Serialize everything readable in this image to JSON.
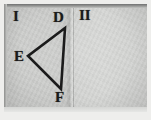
{
  "image": {
    "subject": "folded-paper-geometry-sketch",
    "width": 151,
    "height": 120,
    "background_color": "#eeeeec",
    "paper_color": "#cfd0ce",
    "ink_color": "#1b1b1b"
  },
  "panels": [
    {
      "id": "panel-1",
      "roman_label": "I",
      "contents": "triangle-def"
    },
    {
      "id": "panel-2",
      "roman_label": "II",
      "contents": "blank"
    }
  ],
  "figure": {
    "type": "triangle",
    "name": "triangle-DEF",
    "vertex_labels": {
      "D": "D",
      "E": "E",
      "F": "F"
    },
    "vertices": [
      {
        "label": "D",
        "x": 61,
        "y": 24
      },
      {
        "label": "E",
        "x": 24,
        "y": 52
      },
      {
        "label": "F",
        "x": 57,
        "y": 85
      }
    ],
    "stroke_color": "#1b1b1b",
    "stroke_width": 2.6
  },
  "fold": {
    "orientation": "vertical",
    "position_x": 69,
    "color": "#b4b5b3"
  }
}
